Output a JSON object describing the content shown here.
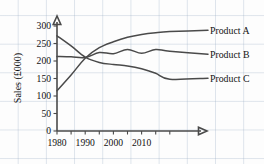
{
  "chart_data": {
    "type": "line",
    "title": "",
    "xlabel": "",
    "ylabel": "Sales (£000)",
    "xlim": [
      1980,
      2020
    ],
    "ylim": [
      0,
      300
    ],
    "grid": "graph-paper-background",
    "legend_position": "right-of-plot-inline",
    "x_ticks": [
      1980,
      1990,
      2000,
      2010
    ],
    "x_ticks_all": [
      1980,
      1985,
      1990,
      1995,
      2000,
      2005,
      2010,
      2015,
      2020
    ],
    "y_ticks": [
      0,
      50,
      100,
      150,
      200,
      250,
      300
    ],
    "x": [
      1980,
      1985,
      1990,
      1995,
      2000,
      2005,
      2010,
      2015,
      2020
    ],
    "series": [
      {
        "name": "Product A",
        "label": "Product A",
        "values": [
          115,
          160,
          208,
          238,
          255,
          268,
          276,
          281,
          284
        ],
        "color": "#4a4a4a"
      },
      {
        "name": "Product B",
        "label": "Product B",
        "values": [
          213,
          212,
          210,
          224,
          221,
          233,
          222,
          233,
          228
        ],
        "color": "#4a4a4a"
      },
      {
        "name": "Product C",
        "label": "Product C",
        "values": [
          272,
          243,
          211,
          196,
          190,
          186,
          178,
          165,
          148
        ],
        "color": "#4a4a4a"
      }
    ],
    "axis_ticks_y_labels": [
      "300",
      "250",
      "200",
      "150",
      "100",
      "50",
      "0"
    ],
    "axis_ticks_x_labels": [
      "1980",
      "1990",
      "2000",
      "2010"
    ]
  }
}
